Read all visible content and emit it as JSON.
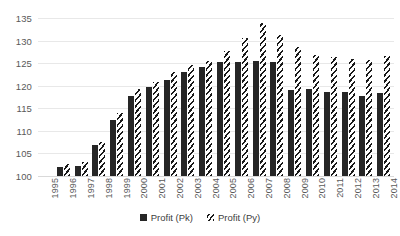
{
  "chart_data": {
    "type": "bar",
    "title": "",
    "xlabel": "",
    "ylabel": "",
    "ylim": [
      100,
      135
    ],
    "ytick_step": 5,
    "yticks": [
      100,
      105,
      110,
      115,
      120,
      125,
      130,
      135
    ],
    "ytick_labels": [
      "100",
      "105",
      "110",
      "115",
      "120",
      "125",
      "130",
      "135"
    ],
    "grid": true,
    "legend_position": "bottom",
    "categories": [
      "1995",
      "1996",
      "1997",
      "1998",
      "1999",
      "2000",
      "2001",
      "2002",
      "2003",
      "2004",
      "2005",
      "2006",
      "2007",
      "2008",
      "2009",
      "2010",
      "2011",
      "2012",
      "2013",
      "2014"
    ],
    "series": [
      {
        "name": "Profit (Pk)",
        "pattern": "solid",
        "color": "#262626",
        "values": [
          null,
          102.0,
          102.2,
          106.8,
          112.5,
          117.8,
          119.8,
          121.2,
          123.0,
          124.2,
          125.2,
          125.3,
          125.5,
          125.2,
          119.0,
          119.3,
          118.7,
          118.6,
          117.8,
          118.3
        ]
      },
      {
        "name": "Profit (Py)",
        "pattern": "diagonal-hatch",
        "color": "#1a1a1a",
        "values": [
          null,
          102.6,
          103.1,
          107.5,
          114.0,
          119.2,
          120.8,
          123.0,
          124.6,
          125.5,
          127.6,
          130.5,
          134.0,
          131.3,
          128.5,
          126.7,
          126.4,
          126.0,
          125.6,
          126.5
        ]
      }
    ]
  },
  "legend": {
    "items": [
      {
        "label": "Profit (Pk)",
        "key": "solid-square-icon"
      },
      {
        "label": "Profit (Py)",
        "key": "hatched-square-icon"
      }
    ]
  }
}
